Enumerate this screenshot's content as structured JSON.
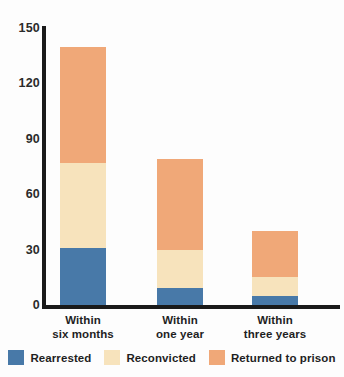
{
  "chart_data": {
    "type": "bar",
    "subtype": "stacked-vertical",
    "title": "",
    "subtitle": "",
    "xlabel": "",
    "ylabel": "",
    "ylim": [
      0,
      150
    ],
    "yticks": [
      0,
      30,
      60,
      90,
      120,
      150
    ],
    "ytick_labels": [
      "0",
      "30",
      "60",
      "90",
      "120",
      "150"
    ],
    "grid": false,
    "legend_position": "bottom",
    "categories": [
      "Within six months",
      "Within one year",
      "Within three years"
    ],
    "category_lines": [
      [
        "Within",
        "six months"
      ],
      [
        "Within",
        "one year"
      ],
      [
        "Within",
        "three years"
      ]
    ],
    "series": [
      {
        "name": "Rearrested",
        "color": "#4879a8",
        "values": [
          31,
          9,
          5
        ]
      },
      {
        "name": "Reconvicted",
        "color": "#f7e3bc",
        "values": [
          46,
          21,
          10
        ]
      },
      {
        "name": "Returned to prison",
        "color": "#f0a878",
        "values": [
          63,
          49,
          25
        ]
      }
    ],
    "totals": [
      140,
      79,
      40
    ]
  },
  "axis": {
    "y_ticks": [
      {
        "label": "150",
        "value": 150
      },
      {
        "label": "120",
        "value": 120
      },
      {
        "label": "90",
        "value": 90
      },
      {
        "label": "60",
        "value": 60
      },
      {
        "label": "30",
        "value": 30
      },
      {
        "label": "0",
        "value": 0
      }
    ]
  },
  "legend": {
    "items": [
      {
        "label": "Rearrested",
        "color": "#4879a8"
      },
      {
        "label": "Reconvicted",
        "color": "#f7e3bc"
      },
      {
        "label": "Returned to prison",
        "color": "#f0a878"
      }
    ]
  },
  "colors": {
    "rearrested": "#4879a8",
    "reconvicted": "#f7e3bc",
    "returned_to_prison": "#f0a878",
    "axis": "#1a1a1a",
    "text": "#1f1f1f",
    "background": "#fdfdfd"
  }
}
